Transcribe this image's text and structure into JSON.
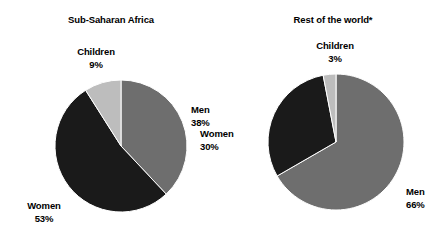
{
  "figure": {
    "background": "#ffffff",
    "text_color": "#000000"
  },
  "colors": {
    "men": "#6e6e6e",
    "women": "#1a1a1a",
    "children": "#bdbdbd"
  },
  "charts": [
    {
      "id": "sub-saharan-africa",
      "title": "Sub-Saharan Africa",
      "center": [
        66,
        66
      ],
      "radius": 66,
      "start_angle": 0,
      "direction": "clockwise",
      "slices": [
        {
          "label": "Men",
          "pct": "38%",
          "value": 38,
          "color": "#6e6e6e"
        },
        {
          "label": "Women",
          "pct": "53%",
          "value": 53,
          "color": "#1a1a1a"
        },
        {
          "label": "Children",
          "pct": "9%",
          "value": 9,
          "color": "#bdbdbd"
        }
      ]
    },
    {
      "id": "rest-of-the-world",
      "title": "Rest of the world*",
      "center": [
        68,
        68
      ],
      "radius": 68,
      "start_angle": 0,
      "direction": "clockwise",
      "slices": [
        {
          "label": "Men",
          "pct": "66%",
          "value": 66,
          "color": "#6e6e6e"
        },
        {
          "label": "Women",
          "pct": "30%",
          "value": 30,
          "color": "#1a1a1a"
        },
        {
          "label": "Children",
          "pct": "3%",
          "value": 3,
          "color": "#bdbdbd"
        }
      ]
    }
  ],
  "chart_data": {
    "type": "pie",
    "title": "",
    "charts": [
      {
        "title": "Sub-Saharan Africa",
        "categories": [
          "Men",
          "Women",
          "Children"
        ],
        "values": [
          38,
          53,
          9
        ],
        "value_labels": [
          "38%",
          "53%",
          "9%"
        ],
        "colors": [
          "#6e6e6e",
          "#1a1a1a",
          "#bdbdbd"
        ],
        "units": "percent",
        "start_angle_deg": 0,
        "direction": "clockwise"
      },
      {
        "title": "Rest of the world*",
        "categories": [
          "Men",
          "Women",
          "Children"
        ],
        "values": [
          66,
          30,
          3
        ],
        "value_labels": [
          "66%",
          "30%",
          "3%"
        ],
        "colors": [
          "#6e6e6e",
          "#1a1a1a",
          "#bdbdbd"
        ],
        "units": "percent",
        "start_angle_deg": 0,
        "direction": "clockwise"
      }
    ],
    "legend": "none",
    "grid": false,
    "annotations": [
      "*"
    ],
    "labels_placement": "outside-callout-text"
  }
}
